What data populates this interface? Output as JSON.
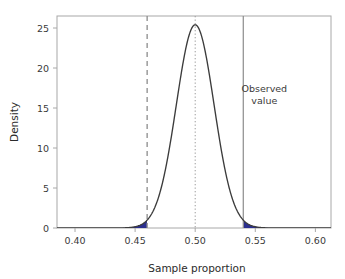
{
  "chart_data": {
    "type": "line",
    "title": "",
    "subtitle": "",
    "xlabel": "Sample proportion",
    "ylabel": "Density",
    "xlim": [
      0.385,
      0.613
    ],
    "ylim": [
      0,
      26.5
    ],
    "grid": false,
    "legend": null,
    "x_ticks": [
      0.4,
      0.45,
      0.5,
      0.55,
      0.6
    ],
    "x_tick_labels": [
      "0.40",
      "0.45",
      "0.50",
      "0.55",
      "0.60"
    ],
    "y_ticks": [
      0,
      5,
      10,
      15,
      20,
      25
    ],
    "y_tick_labels": [
      "0",
      "5",
      "10",
      "15",
      "20",
      "25"
    ],
    "series": [
      {
        "name": "Null distribution density",
        "kind": "normal_density",
        "mean": 0.5,
        "sd": 0.0157,
        "peak_density": 25.4,
        "color": "#3c3c3c",
        "x": [
          0.385,
          0.4,
          0.41,
          0.42,
          0.43,
          0.44,
          0.445,
          0.45,
          0.455,
          0.46,
          0.465,
          0.47,
          0.475,
          0.48,
          0.485,
          0.49,
          0.495,
          0.5,
          0.505,
          0.51,
          0.515,
          0.52,
          0.525,
          0.53,
          0.535,
          0.54,
          0.545,
          0.55,
          0.555,
          0.56,
          0.57,
          0.58,
          0.59,
          0.6,
          0.613
        ],
        "y": [
          0.0,
          0.0,
          0.0,
          0.0,
          0.02,
          0.11,
          0.26,
          0.57,
          1.16,
          2.19,
          3.85,
          6.27,
          9.48,
          13.31,
          17.4,
          21.2,
          24.02,
          25.4,
          24.02,
          21.2,
          17.4,
          13.31,
          9.48,
          6.27,
          3.85,
          2.19,
          1.16,
          0.57,
          0.26,
          0.11,
          0.02,
          0.0,
          0.0,
          0.0,
          0.0
        ]
      }
    ],
    "shaded_regions": [
      {
        "name": "lower-tail",
        "from": 0.385,
        "to": 0.46,
        "color": "#2b2f8f"
      },
      {
        "name": "upper-tail",
        "from": 0.54,
        "to": 0.613,
        "color": "#2b2f8f"
      }
    ],
    "reference_lines": [
      {
        "name": "lower-critical-line",
        "x": 0.46,
        "style": "dashed",
        "color": "#8c8c8c"
      },
      {
        "name": "center-line",
        "x": 0.5,
        "style": "dotted",
        "color": "#9a9a9a"
      },
      {
        "name": "observed-value-line",
        "x": 0.54,
        "style": "solid",
        "color": "#8c8c8c"
      }
    ],
    "annotations": [
      {
        "name": "observed-value-label",
        "line1": "Observed",
        "line2": "value",
        "x": 0.5575,
        "y": 17.0
      }
    ]
  },
  "axes": {
    "x_title": "Sample proportion",
    "y_title": "Density"
  },
  "colors": {
    "curve": "#3c3c3c",
    "tail_fill": "#2b2f8f",
    "frame": "#a8a8a8",
    "reference": "#8c8c8c",
    "text": "#3a3a3a"
  }
}
